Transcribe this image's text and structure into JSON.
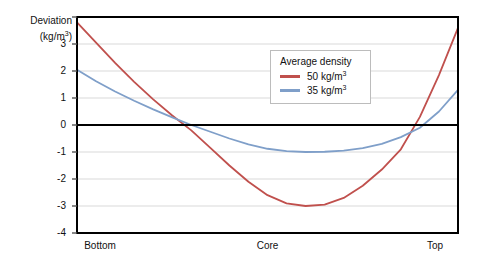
{
  "chart_data": {
    "type": "line",
    "title": "",
    "ylabel": "Deviation (kg/m3)",
    "ylabel_line1": "Deviation",
    "ylabel_line2": "(kg/m",
    "ylabel_line2_sup": "3",
    "ylabel_line2_end": ")",
    "xlabel": "",
    "grid": true,
    "legend_position": "upper-center-right",
    "legend_title": "Average density",
    "ylim": [
      -4,
      4
    ],
    "yticks": [
      4,
      3,
      2,
      1,
      0,
      -1,
      -2,
      -3,
      -4
    ],
    "ytick_labels": [
      "",
      "3",
      "2",
      "1",
      "0",
      "-1",
      "-2",
      "-3",
      "-4"
    ],
    "x": [
      0,
      0.5,
      1
    ],
    "xtick_labels": [
      "Bottom",
      "Core",
      "Top"
    ],
    "zero_line": 0,
    "series": [
      {
        "name": "50 kg/m3",
        "label_main": "50 kg/m",
        "label_sup": "3",
        "color": "#c0504d",
        "x": [
          0.0,
          0.05,
          0.1,
          0.15,
          0.2,
          0.25,
          0.3,
          0.35,
          0.4,
          0.45,
          0.5,
          0.55,
          0.6,
          0.65,
          0.7,
          0.75,
          0.8,
          0.85,
          0.9,
          0.95,
          1.0
        ],
        "values": [
          3.8,
          3.05,
          2.3,
          1.6,
          0.95,
          0.35,
          -0.2,
          -0.85,
          -1.5,
          -2.1,
          -2.6,
          -2.9,
          -3.0,
          -2.95,
          -2.7,
          -2.25,
          -1.65,
          -0.9,
          0.3,
          1.85,
          3.6
        ]
      },
      {
        "name": "35 kg/m3",
        "label_main": "35 kg/m",
        "label_sup": "3",
        "color": "#7f9fc9",
        "x": [
          0.0,
          0.05,
          0.1,
          0.15,
          0.2,
          0.25,
          0.3,
          0.35,
          0.4,
          0.45,
          0.5,
          0.55,
          0.6,
          0.65,
          0.7,
          0.75,
          0.8,
          0.85,
          0.9,
          0.95,
          1.0
        ],
        "values": [
          2.05,
          1.62,
          1.24,
          0.9,
          0.58,
          0.28,
          0.0,
          -0.25,
          -0.5,
          -0.72,
          -0.88,
          -0.97,
          -1.0,
          -0.99,
          -0.95,
          -0.86,
          -0.7,
          -0.45,
          -0.1,
          0.5,
          1.3
        ]
      }
    ]
  },
  "axis": {
    "frame_color": "#000000",
    "grid_color": "#d9d9d9",
    "zero_line_color": "#000000"
  }
}
